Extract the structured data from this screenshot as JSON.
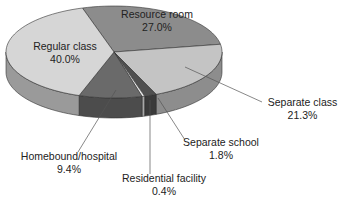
{
  "chart_data": {
    "type": "pie",
    "style": "3d-exploded-none",
    "title": "",
    "unit": "%",
    "slices": [
      {
        "label": "Resource room",
        "value": 27.0,
        "display": "27.0%",
        "color": "#8c8c8c"
      },
      {
        "label": "Separate class",
        "value": 21.3,
        "display": "21.3%",
        "color": "#c4c4c4"
      },
      {
        "label": "Separate school",
        "value": 1.8,
        "display": "1.8%",
        "color": "#505050"
      },
      {
        "label": "Residential facility",
        "value": 0.4,
        "display": "0.4%",
        "color": "#e8e8e8"
      },
      {
        "label": "Homebound/hospital",
        "value": 9.4,
        "display": "9.4%",
        "color": "#6a6a6a"
      },
      {
        "label": "Regular class",
        "value": 40.0,
        "display": "40.0%",
        "color": "#d6d6d6"
      }
    ],
    "start_angle_deg": -17,
    "legend": "none (direct labels with leader lines)"
  },
  "labels": {
    "resource_room": {
      "name": "Resource room",
      "pct": "27.0%"
    },
    "regular_class": {
      "name": "Regular class",
      "pct": "40.0%"
    },
    "separate_class": {
      "name": "Separate class",
      "pct": "21.3%"
    },
    "separate_school": {
      "name": "Separate school",
      "pct": "1.8%"
    },
    "residential_facility": {
      "name": "Residential facility",
      "pct": "0.4%"
    },
    "homebound_hospital": {
      "name": "Homebound/hospital",
      "pct": "9.4%"
    }
  }
}
